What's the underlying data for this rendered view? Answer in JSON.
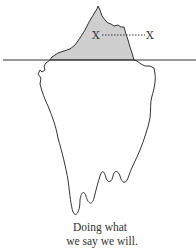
{
  "diagram": {
    "type": "iceberg",
    "markers": {
      "left_label": "X",
      "right_label": "X"
    },
    "caption": {
      "line1": "Doing what",
      "line2": "we say we will."
    },
    "colors": {
      "above_water_fill": "#cfcfcf",
      "outline": "#333333",
      "waterline": "#333333",
      "background": "#ffffff"
    }
  }
}
